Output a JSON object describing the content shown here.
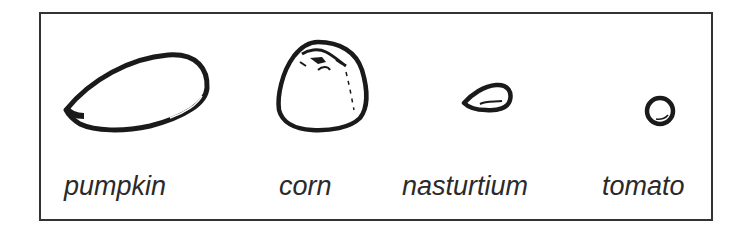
{
  "figure": {
    "type": "seed-size-comparison",
    "border_color": "#333333",
    "ink_color": "#1a1a1a"
  },
  "seeds": [
    {
      "id": "pumpkin",
      "label": "pumpkin",
      "shape": "elongated-teardrop"
    },
    {
      "id": "corn",
      "label": "corn",
      "shape": "rounded-dome"
    },
    {
      "id": "nasturtium",
      "label": "nasturtium",
      "shape": "small-teardrop"
    },
    {
      "id": "tomato",
      "label": "tomato",
      "shape": "small-circle"
    }
  ]
}
